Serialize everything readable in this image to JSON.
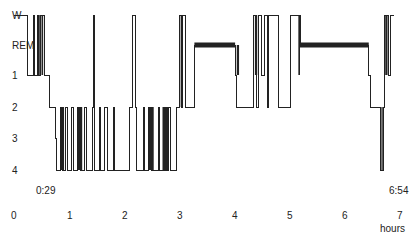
{
  "chart_data": {
    "type": "line",
    "subtype": "hypnogram",
    "title": "",
    "xlabel": "hours",
    "ylabel": "",
    "xlim": [
      0,
      7
    ],
    "x_ticks": [
      "0",
      "1",
      "2",
      "3",
      "4",
      "5",
      "6",
      "7"
    ],
    "y_categories": [
      "W",
      "REM",
      "1",
      "2",
      "3",
      "4"
    ],
    "annotations": {
      "sleep_onset": "0:29",
      "wake_time": "6:54"
    },
    "rem_periods_hours": [
      [
        3.28,
        4.02
      ],
      [
        5.2,
        6.45
      ]
    ],
    "series": [
      {
        "name": "sleep stage",
        "steps": [
          [
            0.0,
            "W"
          ],
          [
            0.2,
            "W"
          ],
          [
            0.25,
            "1"
          ],
          [
            0.35,
            "W"
          ],
          [
            0.37,
            "1"
          ],
          [
            0.42,
            "W"
          ],
          [
            0.45,
            "1"
          ],
          [
            0.48,
            "W"
          ],
          [
            0.55,
            "1"
          ],
          [
            0.65,
            "2"
          ],
          [
            0.75,
            "3"
          ],
          [
            0.78,
            "4"
          ],
          [
            0.85,
            "2"
          ],
          [
            0.88,
            "4"
          ],
          [
            0.93,
            "2"
          ],
          [
            0.97,
            "4"
          ],
          [
            1.05,
            "2"
          ],
          [
            1.08,
            "4"
          ],
          [
            1.15,
            "2"
          ],
          [
            1.2,
            "4"
          ],
          [
            1.28,
            "2"
          ],
          [
            1.32,
            "4"
          ],
          [
            1.42,
            "2"
          ],
          [
            1.45,
            "W"
          ],
          [
            1.47,
            "4"
          ],
          [
            1.55,
            "2"
          ],
          [
            1.58,
            "4"
          ],
          [
            1.65,
            "2"
          ],
          [
            1.7,
            "4"
          ],
          [
            1.8,
            "2"
          ],
          [
            1.83,
            "4"
          ],
          [
            2.1,
            "2"
          ],
          [
            2.15,
            "W"
          ],
          [
            2.2,
            "2"
          ],
          [
            2.22,
            "4"
          ],
          [
            2.35,
            "2"
          ],
          [
            2.38,
            "4"
          ],
          [
            2.45,
            "2"
          ],
          [
            2.5,
            "4"
          ],
          [
            2.62,
            "2"
          ],
          [
            2.65,
            "4"
          ],
          [
            2.8,
            "2"
          ],
          [
            2.85,
            "4"
          ],
          [
            2.95,
            "2"
          ],
          [
            3.0,
            "W"
          ],
          [
            3.05,
            "2"
          ],
          [
            3.07,
            "W"
          ],
          [
            3.12,
            "2"
          ],
          [
            3.2,
            "2"
          ],
          [
            3.28,
            "REM"
          ],
          [
            4.02,
            "1"
          ],
          [
            4.05,
            "2"
          ],
          [
            4.3,
            "2"
          ],
          [
            4.35,
            "W"
          ],
          [
            4.4,
            "2"
          ],
          [
            4.45,
            "W"
          ],
          [
            4.5,
            "1"
          ],
          [
            4.55,
            "W"
          ],
          [
            4.6,
            "2"
          ],
          [
            4.62,
            "W"
          ],
          [
            4.78,
            "W"
          ],
          [
            4.8,
            "2"
          ],
          [
            4.97,
            "2"
          ],
          [
            5.02,
            "W"
          ],
          [
            5.17,
            "W"
          ],
          [
            5.2,
            "REM"
          ],
          [
            6.45,
            "1"
          ],
          [
            6.48,
            "2"
          ],
          [
            6.65,
            "2"
          ],
          [
            6.67,
            "4"
          ],
          [
            6.72,
            "2"
          ],
          [
            6.74,
            "W"
          ],
          [
            6.8,
            "1"
          ],
          [
            6.85,
            "W"
          ],
          [
            6.9,
            "W"
          ]
        ]
      }
    ],
    "grid": false,
    "legend": null
  },
  "labels": {
    "y": [
      "W",
      "REM",
      "1",
      "2",
      "3",
      "4"
    ],
    "x": [
      "0",
      "1",
      "2",
      "3",
      "4",
      "5",
      "6",
      "7"
    ],
    "x_unit": "hours",
    "onset": "0:29",
    "wake": "6:54"
  }
}
